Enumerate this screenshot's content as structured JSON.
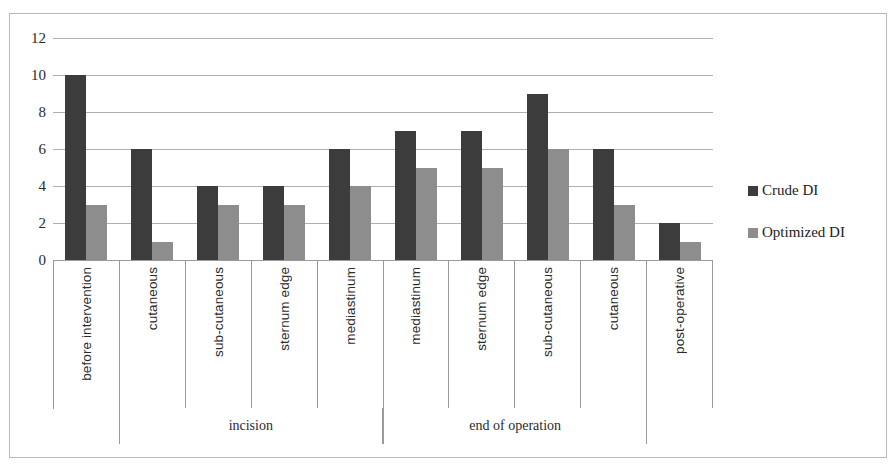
{
  "chart_data": {
    "type": "bar",
    "title": "",
    "subtitle": "",
    "xlabel": "",
    "ylabel": "",
    "ylim": [
      0,
      12
    ],
    "yticks": [
      0,
      2,
      4,
      6,
      8,
      10,
      12
    ],
    "grid": true,
    "legend_position": "right",
    "categories": [
      "before intervention",
      "cutaneous",
      "sub-cutaneous",
      "sternum edge",
      "mediastinum",
      "mediastinum",
      "sternum edge",
      "sub-cutaneous",
      "cutaneous",
      "post-operative"
    ],
    "series": [
      {
        "name": "Crude DI",
        "color": "#3c3c3c",
        "values": [
          10,
          6,
          4,
          4,
          6,
          7,
          7,
          9,
          6,
          2
        ]
      },
      {
        "name": "Optimized DI",
        "color": "#8d8d8d",
        "values": [
          3,
          1,
          3,
          3,
          4,
          5,
          5,
          6,
          3,
          1
        ]
      }
    ],
    "category_groups": [
      {
        "label": "",
        "span": 1
      },
      {
        "label": "incision",
        "span": 4
      },
      {
        "label": "end of operation",
        "span": 4
      },
      {
        "label": "",
        "span": 1
      }
    ]
  },
  "legend": {
    "items": [
      {
        "label": "Crude DI",
        "color": "#3c3c3c"
      },
      {
        "label": "Optimized DI",
        "color": "#8d8d8d"
      }
    ]
  }
}
